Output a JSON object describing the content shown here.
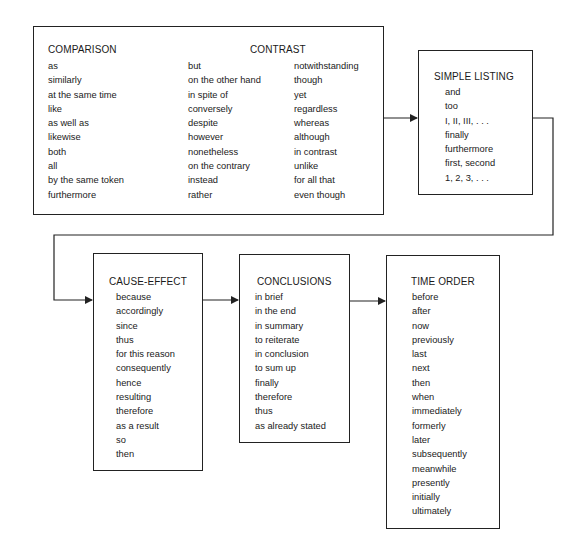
{
  "diagram": {
    "top_box": {
      "comparison": {
        "heading": "COMPARISON",
        "items": [
          "as",
          "similarly",
          "at the same time",
          "like",
          "as well as",
          "likewise",
          "both",
          "all",
          "by the same token",
          "furthermore"
        ]
      },
      "contrast": {
        "heading": "CONTRAST",
        "column1": [
          "but",
          "on the other hand",
          "in spite of",
          "conversely",
          "despite",
          "however",
          "nonetheless",
          "on the contrary",
          "instead",
          "rather"
        ],
        "column2": [
          "notwithstanding",
          "though",
          "yet",
          "regardless",
          "whereas",
          "although",
          "in contrast",
          "unlike",
          "for all that",
          "even though"
        ]
      }
    },
    "simple_listing": {
      "heading": "SIMPLE LISTING",
      "items": [
        "and",
        "too",
        "I, II, III, . . .",
        "finally",
        "furthermore",
        "first, second",
        "1, 2, 3, . . ."
      ]
    },
    "cause_effect": {
      "heading": "CAUSE-EFFECT",
      "items": [
        "because",
        "accordingly",
        "since",
        "thus",
        "for this reason",
        "consequently",
        "hence",
        "resulting",
        "therefore",
        "as a result",
        "so",
        "then"
      ]
    },
    "conclusions": {
      "heading": "CONCLUSIONS",
      "items": [
        "in brief",
        "in the end",
        "in summary",
        "to reiterate",
        "in conclusion",
        "to sum up",
        "finally",
        "therefore",
        "thus",
        "as already stated"
      ]
    },
    "time_order": {
      "heading": "TIME ORDER",
      "items": [
        "before",
        "after",
        "now",
        "previously",
        "last",
        "next",
        "then",
        "when",
        "immediately",
        "formerly",
        "later",
        "subsequently",
        "meanwhile",
        "presently",
        "initially",
        "ultimately"
      ]
    },
    "colors": {
      "line": "#222222",
      "text": "#1a1a1a",
      "background": "#ffffff"
    }
  }
}
